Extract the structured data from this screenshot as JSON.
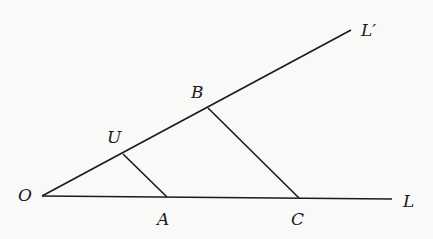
{
  "diagram": {
    "labels": {
      "O": "O",
      "L": "L",
      "L_prime": "L′",
      "U": "U",
      "A": "A",
      "B": "B",
      "C": "C"
    },
    "points": {
      "O": [
        42,
        196
      ],
      "L_end": [
        392,
        199
      ],
      "Lp_end": [
        351,
        30
      ],
      "U": [
        123,
        154
      ],
      "A": [
        167,
        197
      ],
      "B": [
        208,
        108
      ],
      "C": [
        299,
        198
      ]
    },
    "segments": [
      [
        "O",
        "L_end"
      ],
      [
        "O",
        "Lp_end"
      ],
      [
        "U",
        "A"
      ],
      [
        "B",
        "C"
      ]
    ],
    "line_color": "#1a1a1a"
  }
}
